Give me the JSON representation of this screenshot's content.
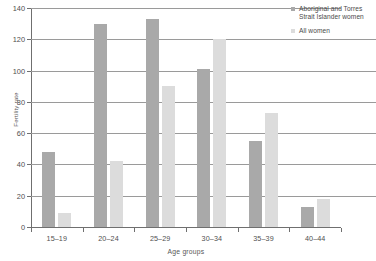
{
  "chart_data": {
    "type": "bar",
    "title": "",
    "subtitle": "",
    "xlabel": "Age groups",
    "ylabel": "Fertility rate",
    "ylim": [
      0,
      140
    ],
    "yticks": [
      0,
      20,
      40,
      60,
      80,
      100,
      120,
      140
    ],
    "grid": "horizontal",
    "legend_position": "top-right",
    "categories": [
      "15–19",
      "20–24",
      "25–29",
      "30–34",
      "35–39",
      "40–44"
    ],
    "series": [
      {
        "name": "Aboriginal and Torres Strait Islander women",
        "color": "#a9a9a9",
        "values": [
          48,
          130,
          133,
          101,
          55,
          13
        ]
      },
      {
        "name": "All women",
        "color": "#dcdcdc",
        "values": [
          9,
          42,
          90,
          120,
          73,
          18
        ]
      }
    ]
  },
  "legend": {
    "items": [
      {
        "label_line1": "Aboriginal and Torres",
        "label_line2": "Strait Islander women"
      },
      {
        "label_line1": "All women",
        "label_line2": ""
      }
    ]
  },
  "axes": {
    "y_title": "Fertility rate",
    "x_title": "Age groups",
    "y_tick_labels": [
      "0",
      "20",
      "40",
      "60",
      "80",
      "100",
      "120",
      "140"
    ],
    "x_tick_labels": [
      "15–19",
      "20–24",
      "25–29",
      "30–34",
      "35–39",
      "40–44"
    ]
  },
  "colors": {
    "series_1": "#a9a9a9",
    "series_2": "#dcdcdc",
    "axis": "#6f6f6f",
    "grid": "#9a9a9a",
    "text": "#4a4a4a",
    "background": "#ffffff"
  }
}
